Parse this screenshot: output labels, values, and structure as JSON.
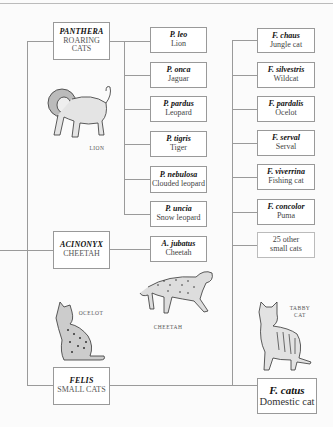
{
  "genera": [
    {
      "name": "PANTHERA",
      "common": "ROARING CATS"
    },
    {
      "name": "ACINONYX",
      "common": "CHEETAH"
    },
    {
      "name": "FELIS",
      "common": "SMALL CATS"
    }
  ],
  "panthera_species": [
    {
      "sci": "P. leo",
      "common": "Lion"
    },
    {
      "sci": "P. onca",
      "common": "Jaguar"
    },
    {
      "sci": "P. pardus",
      "common": "Leopard"
    },
    {
      "sci": "P. tigris",
      "common": "Tiger"
    },
    {
      "sci": "P. nebulosa",
      "common": "Clouded leopard"
    },
    {
      "sci": "P. uncia",
      "common": "Snow leopard"
    }
  ],
  "acinonyx_species": [
    {
      "sci": "A. jubatus",
      "common": "Cheetah"
    }
  ],
  "felis_species": [
    {
      "sci": "F. chaus",
      "common": "Jungle cat"
    },
    {
      "sci": "F. silvestris",
      "common": "Wildcat"
    },
    {
      "sci": "F. pardalis",
      "common": "Ocelot"
    },
    {
      "sci": "F. serval",
      "common": "Serval"
    },
    {
      "sci": "F. viverrina",
      "common": "Fishing cat"
    },
    {
      "sci": "F. concolor",
      "common": "Puma"
    },
    {
      "sci": "",
      "common": "25 other small cats"
    }
  ],
  "domestic": {
    "sci": "F. catus",
    "common": "Domestic cat"
  },
  "captions": {
    "lion": "Lion",
    "cheetah": "Cheetah",
    "ocelot": "Ocelot",
    "tabby": "Tabby cat"
  }
}
